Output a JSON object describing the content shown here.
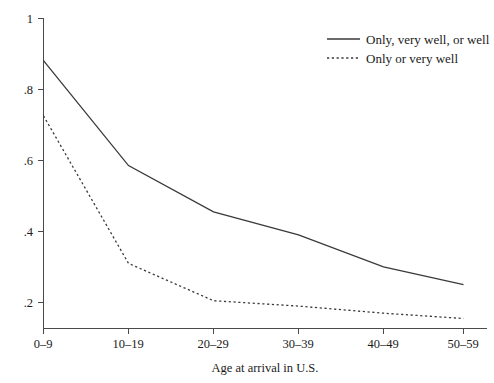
{
  "chart_data": {
    "type": "line",
    "title": "",
    "xlabel": "Age at arrival in U.S.",
    "ylabel": "",
    "categories": [
      "0–9",
      "10–19",
      "20–29",
      "30–39",
      "40–49",
      "50–59"
    ],
    "ylim": [
      0.1,
      1
    ],
    "yticks": [
      1,
      0.8,
      0.6,
      0.4,
      0.2
    ],
    "ytick_labels": [
      "1",
      ".8",
      ".6",
      ".4",
      ".2"
    ],
    "grid": false,
    "legend_position": "top-right",
    "series": [
      {
        "name": "Only, very well, or well",
        "style": "solid",
        "color": "#3a3a3a",
        "values": [
          0.88,
          0.585,
          0.455,
          0.39,
          0.3,
          0.25
        ]
      },
      {
        "name": "Only or very well",
        "style": "dotted",
        "color": "#3a3a3a",
        "values": [
          0.725,
          0.31,
          0.205,
          0.19,
          0.17,
          0.155
        ]
      }
    ]
  },
  "legend": {
    "entries": [
      {
        "label": "Only, very well, or well",
        "style": "solid"
      },
      {
        "label": "Only or very well",
        "style": "dotted"
      }
    ]
  },
  "axes": {
    "x_title": "Age at arrival in U.S.",
    "x_tick_labels": [
      "0–9",
      "10–19",
      "20–29",
      "30–39",
      "40–49",
      "50–59"
    ],
    "y_tick_labels": [
      "1",
      ".8",
      ".6",
      ".4",
      ".2"
    ]
  }
}
